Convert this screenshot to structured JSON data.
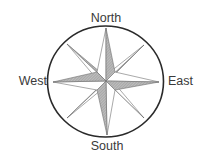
{
  "diagram": {
    "type": "compass-rose",
    "labels": {
      "north": "North",
      "south": "South",
      "east": "East",
      "west": "West"
    },
    "colors": {
      "circle": "#2a2a2a",
      "outline": "#6e6e6e",
      "shade_dark": "#9a9a9a",
      "shade_light": "#ffffff",
      "text": "#3a3a3a"
    },
    "points": 8
  }
}
